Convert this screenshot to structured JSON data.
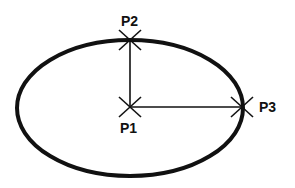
{
  "diagram": {
    "type": "ellipse-construction",
    "ellipse": {
      "cx": 130,
      "cy": 108,
      "rx": 113,
      "ry": 68,
      "stroke": "#111111"
    },
    "points": [
      {
        "label": "P1",
        "x": 130,
        "y": 107,
        "role": "center"
      },
      {
        "label": "P2",
        "x": 130,
        "y": 40,
        "role": "minor-axis endpoint"
      },
      {
        "label": "P3",
        "x": 242,
        "y": 107,
        "role": "major-axis endpoint"
      }
    ],
    "lines": [
      {
        "from": "P1",
        "to": "P2"
      },
      {
        "from": "P1",
        "to": "P3"
      }
    ]
  }
}
